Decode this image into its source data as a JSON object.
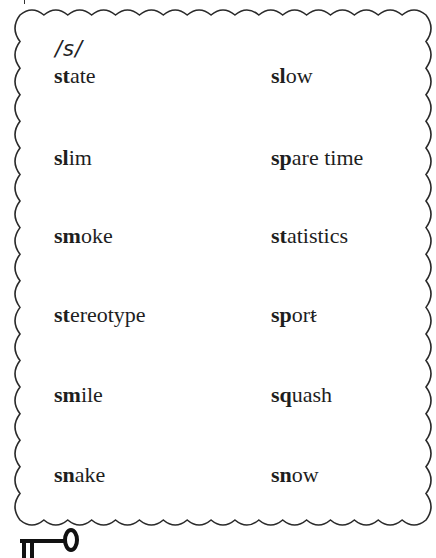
{
  "phoneme_label": "/s/",
  "columns": {
    "left": [
      {
        "bold": "st",
        "rest": "ate",
        "silent": ""
      },
      {
        "bold": "sl",
        "rest": "im",
        "silent": ""
      },
      {
        "bold": "sm",
        "rest": "oke",
        "silent": ""
      },
      {
        "bold": "st",
        "rest": "ereotype",
        "silent": ""
      },
      {
        "bold": "sm",
        "rest": "ile",
        "silent": ""
      },
      {
        "bold": "sn",
        "rest": "ake",
        "silent": ""
      }
    ],
    "right": [
      {
        "bold": "sl",
        "rest": "ow",
        "silent": ""
      },
      {
        "bold": "sp",
        "rest": "are time",
        "silent": ""
      },
      {
        "bold": "st",
        "rest": "atistics",
        "silent": ""
      },
      {
        "bold": "sp",
        "rest": "or",
        "silent": "t"
      },
      {
        "bold": "sq",
        "rest": "uash",
        "silent": ""
      },
      {
        "bold": "sn",
        "rest": "ow",
        "silent": ""
      }
    ]
  },
  "icons": {
    "footer": "key-icon"
  }
}
